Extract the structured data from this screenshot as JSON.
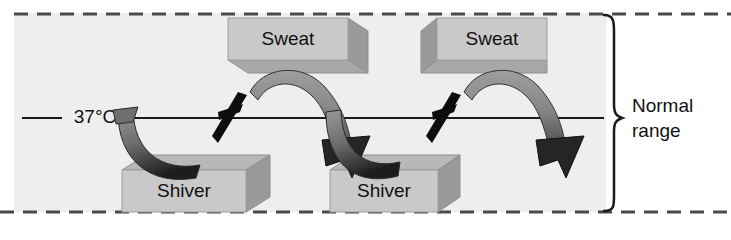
{
  "figure": {
    "background_color": "#ffffff",
    "panel_color": "#eeeeee",
    "panel": {
      "x": 14,
      "y": 13,
      "width": 592,
      "height": 199
    }
  },
  "boundaries": {
    "upper_limit_style": "dashed",
    "lower_limit_style": "dashed",
    "line_color": "#4a4a4a"
  },
  "setpoint": {
    "label": "37°C",
    "line_color": "#1a1a1a",
    "y": 118
  },
  "range_bracket": {
    "label_line1": "Normal",
    "label_line2": "range",
    "brace_color": "#1a1a1a"
  },
  "boxes": [
    {
      "id": "sweat-1",
      "label": "Sweat",
      "kind": "sweat",
      "face_color": "#c9c9c9",
      "top_color": "#b3b3b3",
      "side_color": "#9a9a9a",
      "x": 228,
      "y": 18,
      "width": 120,
      "height": 42
    },
    {
      "id": "sweat-2",
      "label": "Sweat",
      "kind": "sweat",
      "face_color": "#c9c9c9",
      "top_color": "#b3b3b3",
      "side_color": "#9a9a9a",
      "x": 437,
      "y": 18,
      "width": 110,
      "height": 42
    },
    {
      "id": "shiver-1",
      "label": "Shiver",
      "kind": "shiver",
      "face_color": "#c9c9c9",
      "top_color": "#b8b8b8",
      "side_color": "#9a9a9a",
      "x": 122,
      "y": 170,
      "width": 124,
      "height": 42
    },
    {
      "id": "shiver-2",
      "label": "Shiver",
      "kind": "shiver",
      "face_color": "#c9c9c9",
      "top_color": "#b8b8b8",
      "side_color": "#9a9a9a",
      "x": 330,
      "y": 170,
      "width": 108,
      "height": 42
    }
  ],
  "arrows": [
    {
      "id": "arrow-dip-1",
      "direction": "down",
      "description": "curved ribbon dipping below setpoint toward first Shiver box"
    },
    {
      "id": "arrow-arch-1",
      "direction": "up-over-down",
      "description": "arch ribbon rising toward first Sweat box then descending with arrowhead"
    },
    {
      "id": "arrow-dip-2",
      "direction": "down",
      "description": "curved ribbon dipping below setpoint toward second Shiver box"
    },
    {
      "id": "arrow-arch-2",
      "direction": "up-over-down",
      "description": "arch ribbon rising toward second Sweat box then descending with arrowhead"
    }
  ],
  "spikes": [
    {
      "id": "spike-1",
      "description": "black diagonal spike crossing the setpoint line"
    },
    {
      "id": "spike-2",
      "description": "black diagonal spike crossing the setpoint line"
    }
  ]
}
